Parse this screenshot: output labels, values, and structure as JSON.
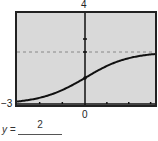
{
  "chart_data": {
    "type": "line",
    "title": "",
    "xlabel": "",
    "ylabel": "",
    "xlim": [
      -3,
      3.2
    ],
    "ylim": [
      -3,
      4
    ],
    "tick_labels": {
      "y_top": "4",
      "y_bottom": "-3",
      "x_center": "0"
    },
    "x_ticks": [
      -2,
      -1,
      0,
      1,
      2,
      3
    ],
    "y_ticks": [
      2,
      1
    ],
    "asymptote": {
      "y": 1,
      "style": "dashed"
    },
    "series": [
      {
        "name": "curve",
        "function": "4/(1+e^(-x)) - 3",
        "x": [
          -3,
          -2,
          -1,
          0,
          1,
          2,
          3
        ],
        "y": [
          -2.81,
          -2.52,
          -1.92,
          -1.0,
          -0.08,
          0.52,
          0.81
        ]
      }
    ],
    "grid": false,
    "background": "#d9d9d9",
    "frame_color": "#222222",
    "curve_color": "#111111"
  },
  "labels": {
    "y_top": "4",
    "y_min": "−3",
    "x_zero": "0",
    "formula_lhs": "y =",
    "formula_numerator": "2"
  }
}
